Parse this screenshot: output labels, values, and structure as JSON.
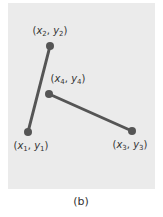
{
  "figure": {
    "caption": "(b)",
    "panel_color": "#ebebeb",
    "line_color": "#555555",
    "point_color": "#555555"
  },
  "points": [
    {
      "id": "p1",
      "label_x": "x",
      "sub": "1",
      "label_y": "y",
      "x": 28,
      "y": 132,
      "label_pos": {
        "left": 33,
        "top": 141
      }
    },
    {
      "id": "p2",
      "label_x": "x",
      "sub": "2",
      "label_y": "y",
      "x": 50,
      "y": 46,
      "label_pos": {
        "left": 50,
        "top": 26
      }
    },
    {
      "id": "p3",
      "label_x": "x",
      "sub": "3",
      "label_y": "y",
      "x": 132,
      "y": 131,
      "label_pos": {
        "left": 130,
        "top": 140
      }
    },
    {
      "id": "p4",
      "label_x": "x",
      "sub": "4",
      "label_y": "y",
      "x": 49,
      "y": 94,
      "label_pos": {
        "left": 68,
        "top": 74
      }
    }
  ],
  "segments": [
    {
      "from": "p1",
      "to": "p2"
    },
    {
      "from": "p4",
      "to": "p3"
    }
  ],
  "labels": {
    "p1": {
      "x": "x",
      "sub": "1",
      "y": "y",
      "open": "(",
      "sep": ", ",
      "close": ")"
    },
    "p2": {
      "x": "x",
      "sub": "2",
      "y": "y",
      "open": "(",
      "sep": ", ",
      "close": ")"
    },
    "p3": {
      "x": "x",
      "sub": "3",
      "y": "y",
      "open": "(",
      "sep": ", ",
      "close": ")"
    },
    "p4": {
      "x": "x",
      "sub": "4",
      "y": "y",
      "open": "(",
      "sep": ", ",
      "close": ")"
    }
  }
}
